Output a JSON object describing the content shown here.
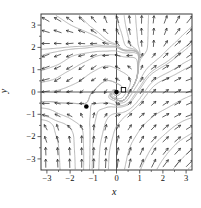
{
  "chart_data": {
    "type": "vector-field-phase-portrait",
    "title": "",
    "xlabel": "x",
    "ylabel": "y",
    "xlim": [
      -3.25,
      3.25
    ],
    "ylim": [
      -3.5,
      3.5
    ],
    "x_ticks": [
      -3,
      -2,
      -1,
      0,
      1,
      2,
      3
    ],
    "y_ticks": [
      -3,
      -2,
      -1,
      0,
      1,
      2,
      3
    ],
    "x_tick_labels": [
      "−3",
      "−2",
      "−1",
      "0",
      "1",
      "2",
      "3"
    ],
    "y_tick_labels": [
      "−3",
      "−2",
      "−1",
      "0",
      "1",
      "2",
      "3"
    ],
    "minor_ticks": [
      -2.5,
      -1.5,
      -0.5,
      0.5,
      1.5,
      2.5
    ],
    "grid": false,
    "interior_axes": true,
    "equilibria": [
      {
        "x": 0,
        "y": 0,
        "marker": "filled-circle"
      },
      {
        "x": -1.3,
        "y": -0.65,
        "marker": "filled-circle"
      }
    ],
    "square_marker": {
      "x": 0.3,
      "y": 0.1
    },
    "arrow_grid": {
      "x_min": -3.05,
      "x_max": 3.15,
      "cols": 13,
      "y_min": -3.2,
      "y_max": 3.25,
      "rows": 13
    },
    "field_samples": [
      [
        0,
        0,
        0,
        0
      ],
      [
        -1.3,
        -0.65,
        0,
        0
      ],
      [
        0.45,
        -0.05,
        0.3,
        0.5
      ],
      [
        0.05,
        0.45,
        -0.5,
        0.25
      ],
      [
        -0.45,
        0.05,
        -0.3,
        -0.5
      ],
      [
        -0.05,
        -0.45,
        0.5,
        -0.25
      ],
      [
        1.0,
        0.1,
        0.55,
        0.85
      ],
      [
        0.15,
        0.95,
        -0.8,
        0.45
      ],
      [
        -0.9,
        0.1,
        -0.6,
        -0.65
      ],
      [
        0.1,
        -0.9,
        0.85,
        0.0
      ],
      [
        -1.9,
        -0.6,
        -0.8,
        0.1
      ],
      [
        -0.75,
        -0.58,
        0.55,
        0.05
      ],
      [
        -1.3,
        -0.2,
        -0.1,
        -0.5
      ],
      [
        -1.3,
        -1.05,
        0.0,
        0.55
      ],
      [
        -1.75,
        -1.25,
        -0.9,
        0.6
      ],
      [
        -0.95,
        -1.15,
        0.2,
        0.85
      ],
      [
        -3.2,
        0.15,
        -1.9,
        -0.3
      ],
      [
        -3.2,
        0.9,
        -1.8,
        -0.6
      ],
      [
        -2.3,
        0.55,
        -1.4,
        -1.0
      ],
      [
        -1.5,
        0.85,
        -1.1,
        -1.0
      ],
      [
        -0.95,
        1.3,
        -1.0,
        -0.75
      ],
      [
        -3.2,
        1.4,
        -1.6,
        -0.8
      ],
      [
        -2.2,
        1.4,
        -1.3,
        -0.9
      ],
      [
        -3.2,
        2.2,
        -1.8,
        0.0
      ],
      [
        -2.1,
        2.2,
        -1.6,
        -0.15
      ],
      [
        -1.1,
        2.0,
        -1.35,
        -0.2
      ],
      [
        -0.3,
        1.9,
        -1.25,
        -0.1
      ],
      [
        0.55,
        1.75,
        -1.0,
        -0.1
      ],
      [
        -2.7,
        2.75,
        -1.7,
        0.6
      ],
      [
        -1.5,
        2.75,
        -1.3,
        0.55
      ],
      [
        -0.5,
        2.6,
        -0.9,
        0.9
      ],
      [
        -3.2,
        3.3,
        -1.7,
        1.0
      ],
      [
        -2.2,
        3.3,
        -1.5,
        1.1
      ],
      [
        -1.2,
        3.3,
        -1.0,
        1.3
      ],
      [
        -0.3,
        3.3,
        -0.55,
        1.5
      ],
      [
        0.5,
        3.3,
        -0.2,
        1.7
      ],
      [
        1.2,
        3.3,
        0.05,
        1.8
      ],
      [
        2.2,
        3.3,
        0.7,
        1.8
      ],
      [
        3.2,
        3.3,
        1.4,
        1.7
      ],
      [
        0.9,
        2.5,
        -0.1,
        1.4
      ],
      [
        0.3,
        2.4,
        -0.35,
        1.5
      ],
      [
        1.45,
        2.3,
        0.05,
        1.3
      ],
      [
        1.3,
        1.55,
        0.5,
        0.5
      ],
      [
        1.9,
        1.15,
        1.3,
        0.8
      ],
      [
        2.6,
        1.9,
        1.3,
        1.1
      ],
      [
        3.2,
        2.6,
        1.4,
        1.3
      ],
      [
        3.2,
        1.2,
        1.6,
        0.85
      ],
      [
        2.2,
        0.6,
        1.5,
        0.7
      ],
      [
        3.2,
        0.3,
        1.7,
        0.55
      ],
      [
        3.2,
        -1,
        1.7,
        0.6
      ],
      [
        2.1,
        -1,
        1.4,
        0.75
      ],
      [
        1.1,
        -1.1,
        1.0,
        0.85
      ],
      [
        0.2,
        -1.2,
        0.7,
        0.85
      ],
      [
        3.2,
        -2,
        1.6,
        1.0
      ],
      [
        2,
        -2,
        1.3,
        1.2
      ],
      [
        1,
        -2,
        0.85,
        1.4
      ],
      [
        0,
        -2.1,
        0.4,
        1.6
      ],
      [
        0.5,
        -3.2,
        0.45,
        2.2
      ],
      [
        1.5,
        -3.2,
        1.0,
        2.0
      ],
      [
        2.4,
        -3.2,
        1.4,
        1.8
      ],
      [
        3.2,
        -3.2,
        1.7,
        1.7
      ],
      [
        -0.3,
        -3.2,
        0.1,
        2.3
      ],
      [
        -1.1,
        -3.2,
        0.05,
        2.3
      ],
      [
        -2.1,
        -3.2,
        -0.05,
        2.2
      ],
      [
        -3.2,
        -3.2,
        0.0,
        2.0
      ],
      [
        -0.6,
        -1.9,
        0.3,
        1.3
      ],
      [
        -1.6,
        -2.2,
        0.0,
        1.5
      ],
      [
        -2.2,
        -2.6,
        -0.1,
        1.7
      ],
      [
        -3.2,
        -2.7,
        -0.05,
        1.8
      ],
      [
        -2.6,
        -1.7,
        -0.25,
        1.25
      ],
      [
        -3.2,
        -1.7,
        -0.4,
        1.1
      ],
      [
        -2.6,
        -0.95,
        -0.9,
        0.5
      ],
      [
        -3.2,
        -1.2,
        -1.5,
        0.25
      ],
      [
        -2.4,
        -1.25,
        -1.2,
        0.3
      ],
      [
        -3.2,
        -0.35,
        -1.8,
        -0.1
      ],
      [
        -2.0,
        -0.3,
        -1.3,
        -0.2
      ]
    ],
    "streamline_seeds": {
      "forward": [
        [
          -1.78,
          -3.45
        ],
        [
          -1.05,
          -3.45
        ],
        [
          -0.35,
          -3.45
        ],
        [
          0.35,
          -3.45
        ],
        [
          1.05,
          -3.45
        ],
        [
          1.75,
          -3.45
        ],
        [
          2.45,
          -3.45
        ],
        [
          3.1,
          -3.45
        ]
      ],
      "backward": [
        [
          3.3,
          3.0
        ],
        [
          1.38,
          3.42
        ],
        [
          0.82,
          3.42
        ],
        [
          0.33,
          3.42
        ],
        [
          -0.05,
          3.42
        ],
        [
          -1.6,
          3.42
        ],
        [
          -2.6,
          3.42
        ],
        [
          -3.42,
          1.9
        ],
        [
          -3.42,
          1.55
        ],
        [
          -3.42,
          0.9
        ],
        [
          -3.42,
          0.4
        ],
        [
          -3.42,
          -0.45
        ],
        [
          -3.42,
          -0.7
        ],
        [
          -3.42,
          -1.2
        ],
        [
          3.42,
          1.6
        ]
      ],
      "both": [
        [
          0.25,
          0.15
        ],
        [
          -0.2,
          -0.12
        ],
        [
          -0.88,
          -0.52
        ]
      ]
    },
    "colors": {
      "streamline": "#b5b5b5",
      "arrow": "#222222",
      "interior_axis": "#333333",
      "box": "#3a3a3a",
      "text": "#111111",
      "marker": "#000000"
    }
  }
}
